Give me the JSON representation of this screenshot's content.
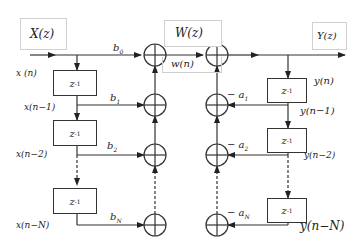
{
  "diagram": {
    "boxes": {
      "input_transform": "X(z)",
      "intermediate_transform": "W(z)",
      "intermediate_signal": "w(n)",
      "output_transform": "Y(z)"
    },
    "delay_label": "z",
    "delay_exp": "-1",
    "left_signals": [
      "x (n)",
      "x(n−1)",
      "x(n−2)",
      "x(n−N)"
    ],
    "right_signals": [
      "y(n)",
      "y(n−1)",
      "y(n−2)",
      "y(n−N)"
    ],
    "feedforward_coeffs": [
      {
        "base": "b",
        "sub": "0"
      },
      {
        "base": "b",
        "sub": "1"
      },
      {
        "base": "b",
        "sub": "2"
      },
      {
        "base": "b",
        "sub": "N"
      }
    ],
    "feedback_coeffs": [
      {
        "base": "− a",
        "sub": "1"
      },
      {
        "base": "− a",
        "sub": "2"
      },
      {
        "base": "− a",
        "sub": "N"
      }
    ],
    "colors": {
      "line": "#333333",
      "box_border": "#cfcfcf",
      "text": "#222222"
    }
  }
}
